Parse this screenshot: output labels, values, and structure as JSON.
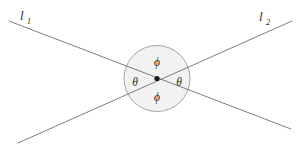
{
  "figure": {
    "background_color": "#ffffff",
    "width": 305,
    "height": 149
  },
  "lines": [
    {
      "name": "line-1",
      "label": "l",
      "subscript": "1",
      "label_x": 20,
      "label_y": 20,
      "sub_x": 27,
      "sub_y": 24,
      "x1": 9,
      "y1": 21,
      "x2": 291,
      "y2": 129,
      "color": "#6f6f6f",
      "stroke_width": 0.9
    },
    {
      "name": "line-2",
      "label": "l",
      "subscript": "2",
      "label_x": 259,
      "label_y": 21,
      "sub_x": 266,
      "sub_y": 25,
      "x1": 18,
      "y1": 143,
      "x2": 292,
      "y2": 21,
      "color": "#6f6f6f",
      "stroke_width": 0.9
    }
  ],
  "circle": {
    "name": "angle-region-circle",
    "cx": 157,
    "cy": 78.5,
    "r": 33,
    "fill_color": "#f2f2f2",
    "stroke_color": "#9a9a9a",
    "stroke_width": 0.9
  },
  "intersection_point": {
    "name": "intersection-dot",
    "cx": 157,
    "cy": 78.5,
    "r": 2.6,
    "color": "#1a1a1a"
  },
  "angle_labels": [
    {
      "name": "angle-phi-top",
      "text": "ϕ",
      "x": 157,
      "y": 66,
      "color": "#2b2b2b"
    },
    {
      "name": "angle-theta-left",
      "text": "θ",
      "x": 135,
      "y": 86,
      "color": "#2b2b2b"
    },
    {
      "name": "angle-theta-right",
      "text": "θ",
      "x": 179,
      "y": 86,
      "color": "#2b2b2b"
    },
    {
      "name": "angle-phi-bottom",
      "text": "ϕ",
      "x": 157,
      "y": 100.5,
      "color": "#2b2b2b"
    }
  ],
  "colors": {
    "line": "#6f6f6f",
    "circle_fill": "#f2f2f2",
    "circle_stroke": "#9a9a9a",
    "text": "#2b2b2b",
    "dot": "#1a1a1a",
    "background": "#ffffff"
  }
}
